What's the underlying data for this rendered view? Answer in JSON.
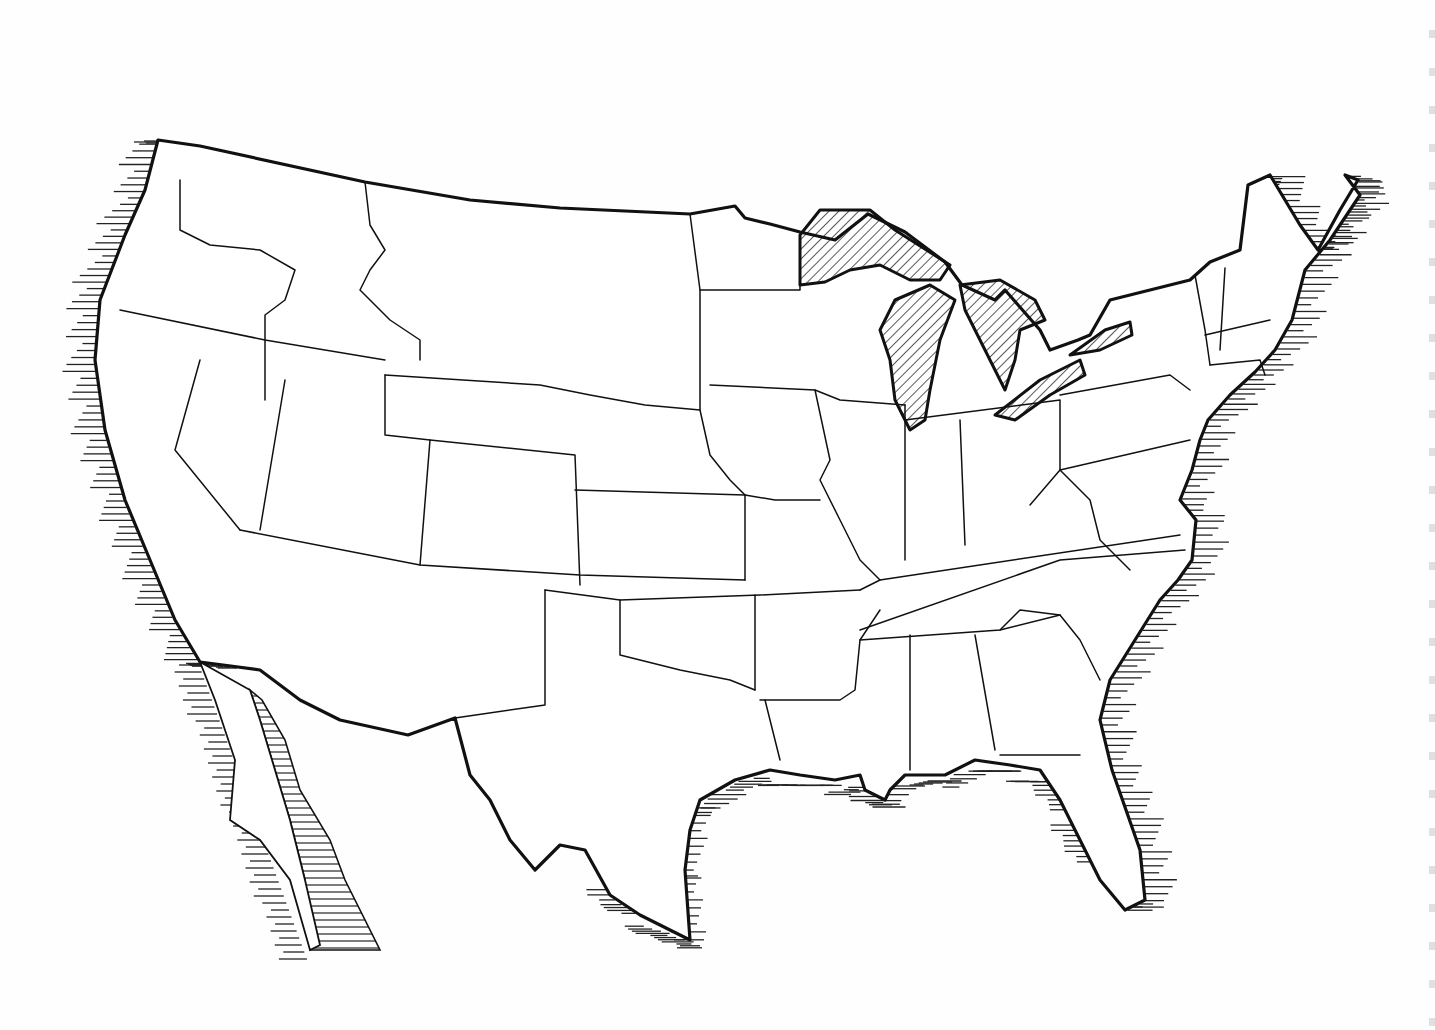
{
  "map": {
    "title": "",
    "subject": "Outline map of the contiguous United States",
    "style": "hand-drawn line art, hatched coastal water, hatched Great Lakes",
    "colors": {
      "ink": "#111111",
      "paper": "#ffffff",
      "hatch": "#222222"
    },
    "labels": [],
    "outline": "M158,140 L200,146 L365,182 L470,200 L560,208 L690,214 L735,206 L745,218 L770,224 L800,232 L835,240 L868,214 L905,232 L945,262 L962,285 L995,300 L1005,290 L1040,330 L1050,350 L1078,340 L1090,335 L1110,300 L1190,280 L1210,262 L1240,250 L1248,185 L1270,175 L1300,225 L1318,250 L1340,210 L1358,180 L1345,175 L1360,195 L1330,240 L1305,270 L1292,320 L1275,350 L1255,372 L1230,395 L1208,420 L1200,440 L1192,470 L1180,500 L1196,520 L1192,560 L1178,580 L1160,600 L1135,640 L1110,680 L1100,720 L1112,770 L1140,850 L1145,900 L1125,910 L1100,880 L1080,840 L1060,800 L1040,770 L1010,765 L975,760 L945,775 L905,775 L890,790 L885,800 L865,790 L860,775 L835,780 L800,775 L770,770 L735,780 L700,800 L690,830 L685,870 L690,940 L670,930 L640,915 L610,895 L585,850 L560,845 L535,870 L510,840 L490,800 L470,775 L455,718 L408,735 L340,720 L300,700 L260,670 L200,662 L175,620 L150,560 L125,500 L105,430 L95,360 L100,300 L125,235 L145,190 Z",
    "interior_lines": [
      "M180,180 L180,230 L210,245 L260,250 L295,270 L285,300 L265,315 L265,400",
      "M120,310 L265,340 L385,360",
      "M200,360 L175,450 L240,530",
      "M285,380 L260,530",
      "M385,375 L385,435 L430,440 L420,565",
      "M365,182 L370,225 L385,250 L370,270 L360,290 L390,320 L420,340 L420,360",
      "M385,375 L540,385 L590,395 L645,405 L700,410",
      "M430,440 L575,455 L580,585",
      "M240,530 L420,565 L580,575 L745,580",
      "M575,490 L745,495",
      "M690,214 L700,290 L700,410 L710,455 L730,480 L745,495 L745,580",
      "M700,290 L800,290 L800,235",
      "M710,385 L815,390 L840,400 L905,405",
      "M815,390 L830,460 L820,480 L840,520 L860,560 L880,580",
      "M745,495 L775,500 L820,500",
      "M545,590 L545,705 L455,718",
      "M545,590 L620,600 L620,655 L680,670 L730,680 L755,690",
      "M620,600 L760,595 L860,590",
      "M755,690 L755,595",
      "M760,700 L840,700 L855,690 L860,640 L880,610",
      "M765,700 L780,760",
      "M860,630 L1060,560 L1185,550",
      "M860,590 L880,580 L1180,535",
      "M905,405 L905,560",
      "M960,420 L965,545",
      "M905,420 L1060,400 L1060,470",
      "M1060,470 L1190,440",
      "M1060,395 L1170,375 L1190,390",
      "M860,640 L1000,630 L1060,615",
      "M910,635 L910,770",
      "M975,635 L995,750",
      "M1000,630 L1020,610 L1060,615 L1080,640 L1100,680",
      "M1000,755 L1080,755",
      "M1030,505 L1060,470 L1090,500 L1100,540 L1130,570",
      "M1195,275 L1205,330 L1210,365",
      "M1225,268 L1220,350",
      "M1205,335 L1270,320",
      "M1210,365 L1260,360 L1265,375"
    ],
    "lakes": [
      {
        "name": "lake-superior",
        "path": "M800,235 L820,210 L870,210 L895,230 L950,265 L940,280 L910,280 L880,265 L850,270 L825,282 L800,285 Z"
      },
      {
        "name": "lake-michigan",
        "path": "M895,300 L930,285 L955,300 L940,340 L930,390 L925,420 L910,430 L895,400 L890,360 L880,330 Z"
      },
      {
        "name": "lake-huron",
        "path": "M960,285 L1000,280 L1035,300 L1045,320 L1020,330 L1015,360 L1005,390 L990,360 L975,330 L965,310 Z"
      },
      {
        "name": "lake-erie",
        "path": "M995,415 L1040,380 L1080,360 L1085,375 L1050,395 L1015,420 Z"
      },
      {
        "name": "lake-ontario",
        "path": "M1070,355 L1105,330 L1130,322 L1132,335 L1100,350 Z"
      }
    ],
    "baja": {
      "peninsula": "M200,662 L215,700 L235,760 L230,820 L260,840 L290,880 L310,950 L320,945 L305,880 L290,820 L275,770 L260,720 L250,690 Z",
      "gulf": "M250,690 L262,700 L285,740 L300,790 L330,840 L345,880 L380,950 L310,950 L305,880 L290,820 L275,770 L260,720 Z"
    }
  }
}
